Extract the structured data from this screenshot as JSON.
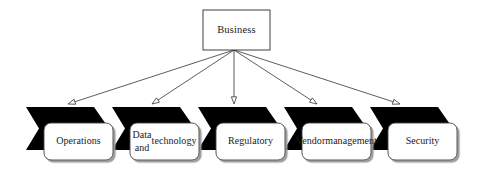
{
  "diagram": {
    "type": "fan-out-hierarchy",
    "title_node": {
      "id": "business",
      "label": "Business",
      "shape": "rectangle",
      "fill": "#ffffff",
      "stroke": "#2b2b2b",
      "x": 203,
      "y": 10,
      "width": 67,
      "height": 40
    },
    "connector": {
      "style": "straight-line",
      "stroke": "#333333",
      "stroke_width": 0.8,
      "arrowhead": "hollow-triangle",
      "arrowhead_fill": "#ffffff",
      "origin_x": 234,
      "origin_y": 50
    },
    "chevron": {
      "fill": "#000000",
      "top": 107,
      "height": 43,
      "width": 83,
      "notch": 13,
      "point": 15
    },
    "leaf_box": {
      "fill": "#ffffff",
      "stroke": "#444444",
      "radius": 7,
      "shadow": "#b5b5b5",
      "top": 123,
      "height": 37,
      "width": 69
    },
    "children": [
      {
        "id": "operations",
        "label": "Operations",
        "lines": [
          "Operations"
        ],
        "chevron_x": 26,
        "box_x": 44,
        "arrow_tip_x": 68,
        "arrow_tip_y": 104
      },
      {
        "id": "data-and-technology",
        "label": "Data and technology",
        "lines": [
          "Data and",
          "technology"
        ],
        "chevron_x": 112,
        "box_x": 130,
        "arrow_tip_x": 152,
        "arrow_tip_y": 104
      },
      {
        "id": "regulatory",
        "label": "Regulatory",
        "lines": [
          "Regulatory"
        ],
        "chevron_x": 198,
        "box_x": 216,
        "arrow_tip_x": 234,
        "arrow_tip_y": 104
      },
      {
        "id": "vendor-management",
        "label": "Vendor management",
        "lines": [
          "Vendor",
          "management"
        ],
        "chevron_x": 284,
        "box_x": 302,
        "arrow_tip_x": 317,
        "arrow_tip_y": 104
      },
      {
        "id": "security",
        "label": "Security",
        "lines": [
          "Security"
        ],
        "chevron_x": 370,
        "box_x": 388,
        "arrow_tip_x": 400,
        "arrow_tip_y": 104
      }
    ]
  }
}
